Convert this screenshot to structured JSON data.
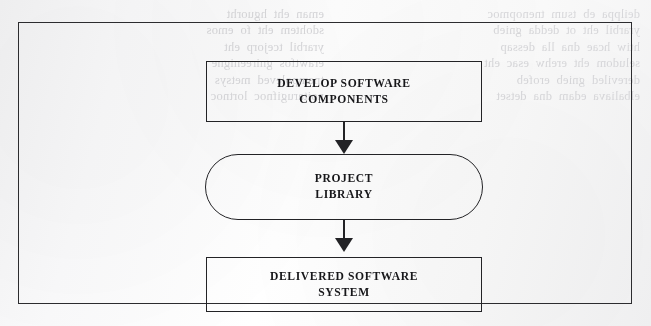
{
  "figure": {
    "outer_frame": "figure-border"
  },
  "diagram": {
    "type": "flow",
    "orientation": "vertical",
    "nodes": [
      {
        "id": "develop",
        "shape": "rectangle",
        "line1": "DEVELOP SOFTWARE",
        "line2": "COMPONENTS"
      },
      {
        "id": "library",
        "shape": "rounded-rectangle",
        "line1": "PROJECT",
        "line2": "LIBRARY"
      },
      {
        "id": "delivered",
        "shape": "rectangle",
        "line1": "DELIVERED SOFTWARE",
        "line2": "SYSTEM"
      }
    ],
    "edges": [
      {
        "id": "edge-1",
        "from": "develop",
        "to": "library",
        "style": "solid-arrow",
        "direction": "down"
      },
      {
        "id": "edge-2",
        "from": "library",
        "to": "delivered",
        "style": "solid-arrow",
        "direction": "down"
      }
    ]
  },
  "colors": {
    "paper": "#fbfbfc",
    "ink": "#232326",
    "frame": "#2c2c2f",
    "bleed_text": "#d7d7da"
  },
  "scan_artifacts": {
    "bleed_left": "eman  eht  hguorht\nsdohtem  eht  fo  emos\nyrarbil  tcejorp  eht\nerawtfos  gnireenigne\ntnempoleved  metsys\nnoitarugifnoc  lortnoc",
    "bleed_right": "deilppa  eb  tsum  tnenopmoc\nyrarbil  eht  ot  dedda  gnieb\nhtiw  hcae  dna  lla  dessap\nseludom  eht  erehw  esac  eht\ndereviled  gnieb  erofeb\nelbaliava  edam  dna  detset"
  }
}
